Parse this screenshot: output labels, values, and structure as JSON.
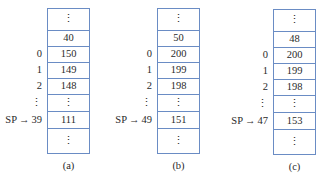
{
  "figure": {
    "panels": [
      {
        "caption": "(a)",
        "sp_label": "SP",
        "sp_arrow": "→",
        "cells": [
          {
            "index": "",
            "value": "⋮"
          },
          {
            "index": "",
            "value": "40"
          },
          {
            "index": "0",
            "value": "150"
          },
          {
            "index": "1",
            "value": "149"
          },
          {
            "index": "2",
            "value": "148"
          },
          {
            "index": "⋮",
            "value": "⋮"
          },
          {
            "index": "39",
            "value": "111",
            "sp": true
          },
          {
            "index": "",
            "value": "⋮"
          }
        ]
      },
      {
        "caption": "(b)",
        "sp_label": "SP",
        "sp_arrow": "→",
        "cells": [
          {
            "index": "",
            "value": "⋮"
          },
          {
            "index": "",
            "value": "50"
          },
          {
            "index": "0",
            "value": "200"
          },
          {
            "index": "1",
            "value": "199"
          },
          {
            "index": "2",
            "value": "198"
          },
          {
            "index": "⋮",
            "value": "⋮"
          },
          {
            "index": "49",
            "value": "151",
            "sp": true
          },
          {
            "index": "",
            "value": "⋮"
          }
        ]
      },
      {
        "caption": "(c)",
        "sp_label": "SP",
        "sp_arrow": "→",
        "cells": [
          {
            "index": "",
            "value": "⋮"
          },
          {
            "index": "",
            "value": "48"
          },
          {
            "index": "0",
            "value": "200"
          },
          {
            "index": "1",
            "value": "199"
          },
          {
            "index": "2",
            "value": "198"
          },
          {
            "index": "⋮",
            "value": "⋮"
          },
          {
            "index": "47",
            "value": "153",
            "sp": true
          },
          {
            "index": "",
            "value": "⋮"
          }
        ]
      }
    ],
    "colors": {
      "cell_border": "#6a8cc4",
      "text": "#2a2a2a"
    }
  }
}
